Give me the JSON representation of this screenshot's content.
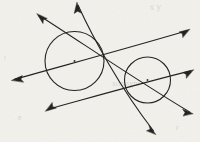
{
  "figure": {
    "background_color": "#f3f1ec",
    "ink_color": "#262422",
    "stroke_width": 1.1,
    "width": 200,
    "height": 142,
    "circles": [
      {
        "name": "left-circle",
        "cx": 74.5,
        "cy": 61.0,
        "r": 29.5,
        "center_dot_label": "",
        "center_dot_r": 1.0
      },
      {
        "name": "right-circle",
        "cx": 147.5,
        "cy": 80.0,
        "r": 23.0,
        "center_dot_label": "",
        "center_dot_r": 1.0
      }
    ],
    "lines": [
      {
        "name": "tangent-line-upper-external",
        "description": "external tangent running from lower-left to upper-right above both circles",
        "x1": 13.0,
        "y1": 80.0,
        "x2": 188.5,
        "y2": 30.0,
        "arrow_start": true,
        "arrow_end": true
      },
      {
        "name": "tangent-line-lower-external",
        "description": "external tangent running from upper-left to lower-right below both circles",
        "x1": 38.0,
        "y1": 14.5,
        "x2": 192.0,
        "y2": 113.0,
        "arrow_start": true,
        "arrow_end": true
      },
      {
        "name": "tangent-line-internal-steep",
        "description": "internal tangent, steep, from top-center down to bottom-right",
        "x1": 77.0,
        "y1": 3.5,
        "x2": 155.0,
        "y2": 133.0,
        "arrow_start": true,
        "arrow_end": true
      },
      {
        "name": "tangent-line-internal-shallow",
        "description": "internal tangent, shallow, from bottom-left up to right edge",
        "x1": 46.5,
        "y1": 110.5,
        "x2": 192.5,
        "y2": 70.0,
        "arrow_start": true,
        "arrow_end": true
      }
    ],
    "arrowheads": [
      {
        "name": "arrowhead-upper-left",
        "x": 38.0,
        "y": 14.5,
        "direction": "up-left"
      },
      {
        "name": "arrowhead-top-center",
        "x": 77.0,
        "y": 3.5,
        "direction": "up"
      },
      {
        "name": "arrowhead-upper-right",
        "x": 188.5,
        "y": 30.0,
        "direction": "up-right"
      },
      {
        "name": "arrowhead-mid-left",
        "x": 13.0,
        "y": 80.0,
        "direction": "left"
      },
      {
        "name": "arrowhead-mid-right",
        "x": 192.5,
        "y": 70.0,
        "direction": "right"
      },
      {
        "name": "arrowhead-lower-left",
        "x": 46.5,
        "y": 110.5,
        "direction": "down-left"
      },
      {
        "name": "arrowhead-lower-right",
        "x": 192.0,
        "y": 113.0,
        "direction": "right"
      },
      {
        "name": "arrowhead-bottom-center",
        "x": 155.0,
        "y": 133.0,
        "direction": "down-right"
      }
    ],
    "ghost_marks": [
      {
        "name": "ghost-mark-top-right",
        "text": "x y",
        "x": 150,
        "y": 6,
        "size": 9,
        "rotate": -3
      },
      {
        "name": "ghost-mark-mid-right",
        "text": "xomsgni",
        "x": 112,
        "y": 84,
        "size": 8,
        "rotate": 0
      },
      {
        "name": "ghost-mark-bottom-left",
        "text": "e",
        "x": 18,
        "y": 118,
        "size": 8,
        "rotate": 0
      },
      {
        "name": "ghost-mark-bottom-right",
        "text": "r",
        "x": 176,
        "y": 128,
        "size": 8,
        "rotate": 0
      }
    ]
  }
}
